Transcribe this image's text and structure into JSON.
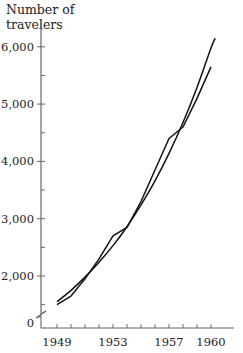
{
  "chart_data": {
    "type": "line",
    "title": "",
    "xlabel": "",
    "ylabel": "Number of travelers",
    "ylabel_lines": [
      "Number of",
      "travelers"
    ],
    "x": [
      1949,
      1950,
      1951,
      1952,
      1953,
      1954,
      1955,
      1956,
      1957,
      1958,
      1959,
      1960
    ],
    "x_tick_labels": [
      "1949",
      "1953",
      "1957",
      "1960"
    ],
    "x_tick_label_values": [
      1949,
      1953,
      1957,
      1960
    ],
    "y_tick_labels": [
      "0",
      "2,000",
      "3,000",
      "4,000",
      "5,000",
      "6,000"
    ],
    "y_tick_values": [
      0,
      2000,
      3000,
      4000,
      5000,
      6000
    ],
    "y_minor_ticks": [
      1500,
      2500,
      3500,
      4500,
      5500
    ],
    "axis_break": true,
    "ylim": [
      0,
      6000
    ],
    "xlim": [
      1948.2,
      1961.6
    ],
    "grid": false,
    "legend": null,
    "series": [
      {
        "name": "actual",
        "style": "jagged",
        "values": [
          1500,
          1650,
          1950,
          2300,
          2700,
          2850,
          3300,
          3850,
          4400,
          4600,
          5100,
          5650
        ]
      },
      {
        "name": "exponential fit",
        "style": "smooth",
        "values": [
          1550,
          1750,
          1980,
          2240,
          2530,
          2860,
          3240,
          3660,
          4140,
          4680,
          5290,
          5980
        ]
      }
    ],
    "line_color": "#111111",
    "axis_color": "#666666"
  }
}
